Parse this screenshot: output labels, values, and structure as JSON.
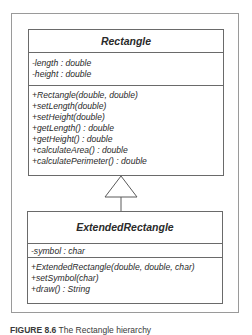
{
  "diagram": {
    "type": "UML class diagram",
    "classes": [
      {
        "name": "Rectangle",
        "attributes": [
          "-length : double",
          "-height : double"
        ],
        "operations": [
          "+Rectangle(double, double)",
          "+setLength(double)",
          "+setHeight(double)",
          "+getLength() : double",
          "+getHeight() : double",
          "+calculateArea() : double",
          "+calculatePerimeter() : double"
        ]
      },
      {
        "name": "ExtendedRectangle",
        "attributes": [
          "-symbol : char"
        ],
        "operations": [
          "+ExtendedRectangle(double, double, char)",
          "+setSymbol(char)",
          "+draw() : String"
        ]
      }
    ],
    "relationships": [
      {
        "type": "generalization",
        "from": "ExtendedRectangle",
        "to": "Rectangle"
      }
    ]
  },
  "caption": {
    "label": "FIGURE 8.6",
    "text": "The Rectangle hierarchy"
  }
}
